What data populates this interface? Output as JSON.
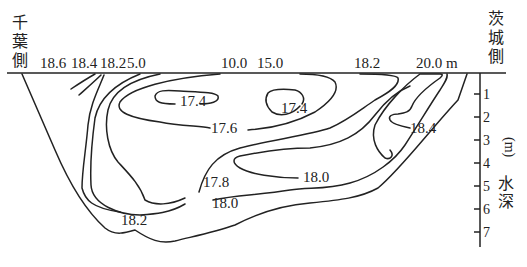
{
  "left_bank_label": [
    "千",
    "葉",
    "側"
  ],
  "right_bank_label": [
    "茨",
    "城",
    "側"
  ],
  "top_labels": [
    "18.6",
    "18.4",
    "18.2",
    "5.0",
    "10.0",
    "15.0",
    "18.2",
    "20.0 m"
  ],
  "depth_axis": {
    "ticks": [
      "1",
      "2",
      "3",
      "4",
      "5",
      "6",
      "7"
    ],
    "title_chars": [
      "水",
      "深"
    ],
    "unit": "(m)"
  },
  "contour_labels": {
    "c174a": "17.4",
    "c174b": "17.4",
    "c176": "17.6",
    "c178": "17.8",
    "c180a": "18.0",
    "c180b": "18.0",
    "c182": "18.2",
    "c184": "18.4"
  },
  "colors": {
    "ink": "#222222",
    "background": "#ffffff"
  }
}
